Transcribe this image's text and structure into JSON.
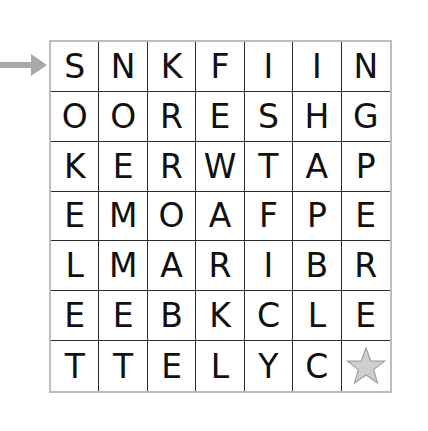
{
  "puzzle": {
    "type": "letter-grid",
    "rows": 7,
    "cols": 7,
    "start_row_indicator": "arrow pointing at row 1",
    "grid": [
      [
        "S",
        "N",
        "K",
        "F",
        "I",
        "I",
        "N"
      ],
      [
        "O",
        "O",
        "R",
        "E",
        "S",
        "H",
        "G"
      ],
      [
        "K",
        "E",
        "R",
        "W",
        "T",
        "A",
        "P"
      ],
      [
        "E",
        "M",
        "O",
        "A",
        "F",
        "P",
        "E"
      ],
      [
        "L",
        "M",
        "A",
        "R",
        "I",
        "B",
        "R"
      ],
      [
        "E",
        "E",
        "B",
        "K",
        "C",
        "L",
        "E"
      ],
      [
        "T",
        "T",
        "E",
        "L",
        "Y",
        "C",
        "star-icon"
      ]
    ],
    "colors": {
      "arrow": "#a9a9a9",
      "star_fill": "#cfcfcf",
      "star_stroke": "#a0a0a0",
      "outer_border": "#bdbdbd",
      "inner_lines": "#2b2b2b",
      "text": "#111111"
    }
  }
}
